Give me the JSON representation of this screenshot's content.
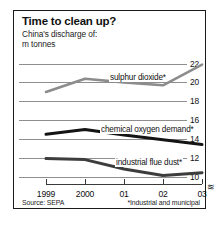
{
  "card": {
    "title": "Time to clean up?",
    "subtitle_line_1": "China's discharge of:",
    "subtitle_line_2": "m tonnes",
    "source": "Source: SEPA",
    "footnote": "*Industrial and municipal",
    "axis_break_symbol": "≋",
    "border_color": "#1a1a1a"
  },
  "chart_data": {
    "type": "line",
    "title": "Time to clean up?",
    "subtitle": "China's discharge of: m tonnes",
    "xlabel": "",
    "ylabel": "m tonnes",
    "categories": [
      "1999",
      "2000",
      "01",
      "02",
      "03"
    ],
    "x_tick_labels": [
      "1999",
      "2000",
      "01",
      "02",
      "03"
    ],
    "y_tick_labels": [
      "22",
      "20",
      "18",
      "16",
      "14",
      "12",
      "10"
    ],
    "y_ticks": [
      22,
      20,
      18,
      16,
      14,
      12,
      10
    ],
    "ylim": [
      9.2,
      22.6
    ],
    "grid": true,
    "grid_axis": "y",
    "legend": "inline-labels",
    "axis_break": true,
    "series": [
      {
        "name": "sulphur dioxide*",
        "label": "sulphur dioxide*",
        "color": "#8c8c8c",
        "width": 2.6,
        "values": [
          19.0,
          20.4,
          20.0,
          19.7,
          21.9
        ]
      },
      {
        "name": "chemical oxygen demand*",
        "label": "chemical oxygen demand*",
        "color": "#141414",
        "width": 3.0,
        "values": [
          14.5,
          15.0,
          14.4,
          13.9,
          13.4
        ]
      },
      {
        "name": "industrial flue dust*",
        "label": "industrial flue dust*",
        "color": "#3d3d3d",
        "width": 3.0,
        "values": [
          11.9,
          11.8,
          10.8,
          10.1,
          10.4
        ]
      }
    ],
    "source": "Source: SEPA",
    "annotations": [
      "*Industrial and municipal"
    ]
  }
}
